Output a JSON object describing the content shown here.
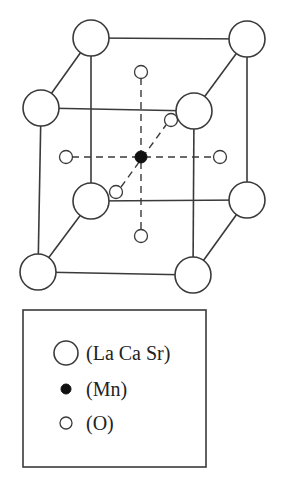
{
  "diagram": {
    "type": "perovskite-unit-cell",
    "colors": {
      "stroke": "#3a3a3a",
      "mn_fill": "#111111",
      "background": "#ffffff"
    },
    "corner_atoms_label": "La Ca Sr",
    "center_atom_label": "Mn",
    "face_atoms_label": "O"
  },
  "legend": {
    "items": [
      {
        "symbol": "large-open-circle",
        "label": "(La Ca Sr)"
      },
      {
        "symbol": "small-filled-circle",
        "label": "(Mn)"
      },
      {
        "symbol": "small-open-circle",
        "label": "(O)"
      }
    ]
  }
}
